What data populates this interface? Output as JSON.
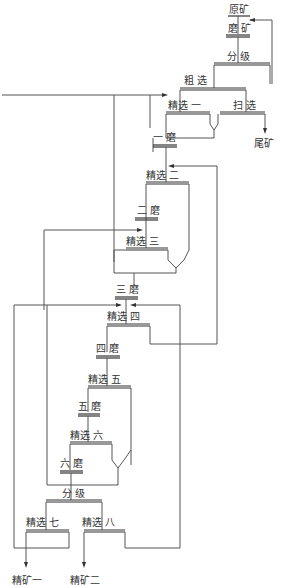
{
  "diagram": {
    "type": "flowsheet",
    "nodes": {
      "raw_ore": "原矿",
      "grinding": "磨 矿",
      "classify_1": "分 级",
      "rougher": "粗 选",
      "cleaner_1": "精选 一",
      "scavenger": "扫 选",
      "tailings": "尾矿",
      "regrind_1": "一 磨",
      "cleaner_2": "精选 二",
      "regrind_2": "二 磨",
      "cleaner_3": "精选 三",
      "regrind_3": "三 磨",
      "cleaner_4": "精选 四",
      "regrind_4": "四 磨",
      "cleaner_5": "精选 五",
      "regrind_5": "五 磨",
      "cleaner_6": "精选 六",
      "regrind_6": "六 磨",
      "classify_2": "分 级",
      "cleaner_7": "精选 七",
      "cleaner_8": "精选 八",
      "concentrate_1": "精矿一",
      "concentrate_2": "精矿二"
    }
  }
}
